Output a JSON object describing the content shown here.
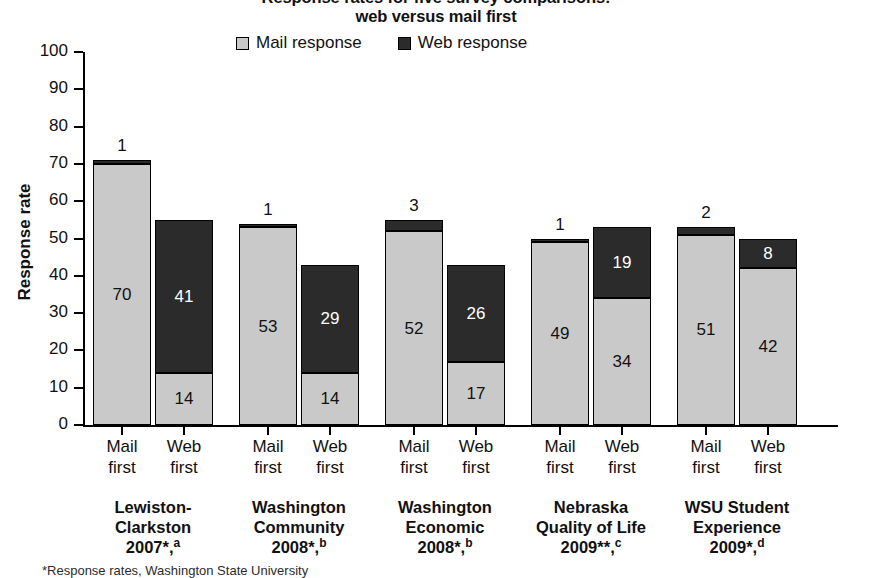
{
  "chart_data": {
    "type": "bar",
    "subtype": "stacked-grouped-bar",
    "title": "Response rates for five survey comparisons:",
    "title_line2": "web versus mail first",
    "ylabel": "Response rate",
    "xlabel": "",
    "ylim": [
      0,
      100
    ],
    "yticks": [
      0,
      10,
      20,
      30,
      40,
      50,
      60,
      70,
      80,
      90,
      100
    ],
    "grid": false,
    "legend_position": "top-center",
    "legend": [
      {
        "name": "Mail response",
        "color": "#c9c9c9"
      },
      {
        "name": "Web response",
        "color": "#2b2b2b"
      }
    ],
    "series": [
      {
        "name": "Mail response",
        "color": "#c9c9c9"
      },
      {
        "name": "Web response",
        "color": "#2b2b2b"
      }
    ],
    "categories": [
      "Lewiston-Clarkston 2007*,a",
      "Washington Community 2008*,b",
      "Washington Economic 2008*,b",
      "Nebraska Quality of Life 2009**,c",
      "WSU Student Experience 2009*,d"
    ],
    "subcategories": [
      "Mail first",
      "Web first"
    ],
    "groups": [
      {
        "name_lines": [
          "Lewiston-",
          "Clarkston"
        ],
        "year": "2007",
        "marks": "*",
        "note": "a",
        "bars": [
          {
            "sub_line1": "Mail",
            "sub_line2": "first",
            "mail": 70,
            "web": 1,
            "total": 71
          },
          {
            "sub_line1": "Web",
            "sub_line2": "first",
            "mail": 14,
            "web": 41,
            "total": 55
          }
        ]
      },
      {
        "name_lines": [
          "Washington",
          "Community"
        ],
        "year": "2008",
        "marks": "*",
        "note": "b",
        "bars": [
          {
            "sub_line1": "Mail",
            "sub_line2": "first",
            "mail": 53,
            "web": 1,
            "total": 54
          },
          {
            "sub_line1": "Web",
            "sub_line2": "first",
            "mail": 14,
            "web": 29,
            "total": 43
          }
        ]
      },
      {
        "name_lines": [
          "Washington",
          "Economic"
        ],
        "year": "2008",
        "marks": "*",
        "note": "b",
        "bars": [
          {
            "sub_line1": "Mail",
            "sub_line2": "first",
            "mail": 52,
            "web": 3,
            "total": 55
          },
          {
            "sub_line1": "Web",
            "sub_line2": "first",
            "mail": 17,
            "web": 26,
            "total": 43
          }
        ]
      },
      {
        "name_lines": [
          "Nebraska",
          "Quality of Life"
        ],
        "year": "2009",
        "marks": "**",
        "note": "c",
        "bars": [
          {
            "sub_line1": "Mail",
            "sub_line2": "first",
            "mail": 49,
            "web": 1,
            "total": 50
          },
          {
            "sub_line1": "Web",
            "sub_line2": "first",
            "mail": 34,
            "web": 19,
            "total": 53
          }
        ]
      },
      {
        "name_lines": [
          "WSU Student",
          "Experience"
        ],
        "year": "2009",
        "marks": "*",
        "note": "d",
        "bars": [
          {
            "sub_line1": "Mail",
            "sub_line2": "first",
            "mail": 51,
            "web": 2,
            "total": 53
          },
          {
            "sub_line1": "Web",
            "sub_line2": "first",
            "mail": 42,
            "web": 8,
            "total": 50
          }
        ]
      }
    ],
    "footnote": "*Response rates, Washington State University"
  }
}
